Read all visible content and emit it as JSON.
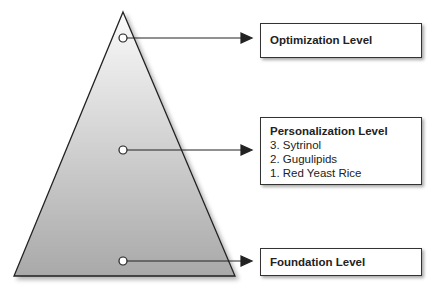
{
  "diagram": {
    "type": "pyramid",
    "levels": [
      {
        "id": "optimization",
        "title": "Optimization Level",
        "items": []
      },
      {
        "id": "personalization",
        "title": "Personalization Level",
        "items": [
          "3. Sytrinol",
          "2. Gugulipids",
          "1. Red Yeast Rice"
        ]
      },
      {
        "id": "foundation",
        "title": "Foundation Level",
        "items": []
      }
    ]
  }
}
